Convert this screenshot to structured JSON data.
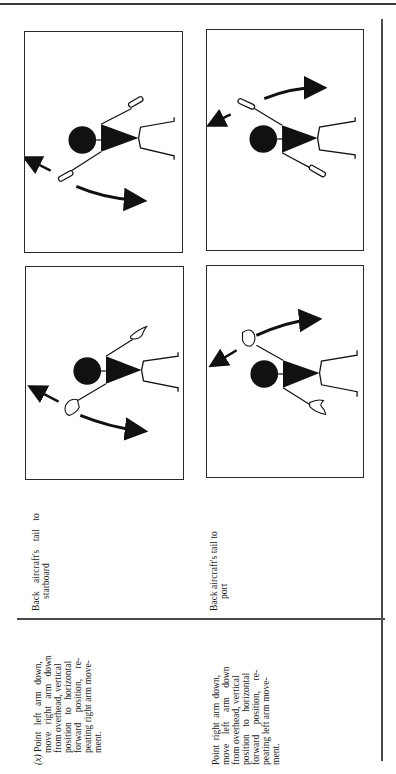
{
  "page": {
    "orientation": "rotated-90-ccw",
    "rows": [
      {
        "label": "(x)",
        "description_lines": [
          "Point left arm down,",
          "move right arm down",
          "from overhead, vertical",
          "position to horizontal",
          "forward position, re-",
          "peating right arm move-",
          "ment."
        ],
        "meaning_lines": [
          "Back aircraft's tail to",
          "starboard"
        ],
        "figures": [
          {
            "name": "signal-figure-wands",
            "implement": "illuminated wands",
            "description": "Left arm pointing down, right arm sweeping from overhead to horizontal"
          },
          {
            "name": "signal-figure-hands",
            "implement": "hands",
            "description": "Left arm pointing down, right arm sweeping from overhead to horizontal"
          }
        ]
      },
      {
        "label": "",
        "description_lines": [
          "Point right arm down,",
          "move left arm down",
          "from overhead, vertical",
          "position to horizontal",
          "forward position, re-",
          "peating left arm move-",
          "ment."
        ],
        "meaning_lines": [
          "Back aircraft's tail to",
          "port"
        ],
        "figures": [
          {
            "name": "signal-figure-wands",
            "implement": "illuminated wands",
            "description": "Right arm pointing down, left arm sweeping from overhead to horizontal"
          },
          {
            "name": "signal-figure-hands",
            "implement": "hands",
            "description": "Right arm pointing down, left arm sweeping from overhead to horizontal"
          }
        ]
      }
    ],
    "colors": {
      "ink": "#1a1a1a",
      "paper": "#ffffff",
      "rule": "#4a4a4a"
    }
  }
}
